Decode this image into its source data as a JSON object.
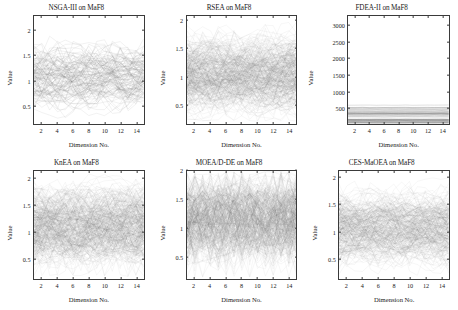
{
  "figure": {
    "name": "parallel-coordinates-grid",
    "rows": 2,
    "cols": 3,
    "background": "#ffffff",
    "line_color": "#6e6e6e",
    "axis_color": "#3a3a3a",
    "text_color": "#1a1a1a"
  },
  "common": {
    "xlabel": "Dimension No.",
    "ylabel": "Value",
    "xticks": [
      "2",
      "4",
      "6",
      "8",
      "10",
      "12",
      "14"
    ],
    "xtick_values": [
      2,
      4,
      6,
      8,
      10,
      12,
      14
    ],
    "xlim": [
      1,
      15
    ],
    "dimensions": 15
  },
  "chart_data": [
    {
      "type": "line",
      "panel": 1,
      "title": "NSGA-III on MaF8",
      "xlabel": "Dimension No.",
      "ylabel": "Value",
      "xlim": [
        1,
        15
      ],
      "ylim": [
        0.12,
        2.3
      ],
      "xticks": [
        2,
        4,
        6,
        8,
        10,
        12,
        14
      ],
      "yticks": [
        0.5,
        1,
        1.5,
        2
      ],
      "ytick_labels": [
        "0.5",
        "1",
        "1.5",
        "2"
      ],
      "grid": false,
      "legend": "none",
      "plot_style": "parallel-coordinates",
      "n_lines": 120,
      "band": {
        "center": 1.05,
        "spread": 0.42,
        "min": 0.18,
        "max": 2.25
      },
      "description": "Sparse wide-swinging parallel coordinate lines, dense core near 1.0-1.5"
    },
    {
      "type": "line",
      "panel": 2,
      "title": "RSEA on MaF8",
      "xlabel": "Dimension No.",
      "ylabel": "Value",
      "xlim": [
        1,
        15
      ],
      "ylim": [
        0.15,
        2.08
      ],
      "xticks": [
        2,
        4,
        6,
        8,
        10,
        12,
        14
      ],
      "yticks": [
        0.5,
        1,
        1.5,
        2
      ],
      "ytick_labels": [
        "0.5",
        "1",
        "1.5",
        "2"
      ],
      "grid": false,
      "legend": "none",
      "plot_style": "parallel-coordinates",
      "n_lines": 300,
      "band": {
        "center": 1.05,
        "spread": 0.45,
        "min": 0.2,
        "max": 2.0
      },
      "description": "Very dense band filling 0.4-1.9, saturated core"
    },
    {
      "type": "line",
      "panel": 3,
      "title": "FDEA-II on MaF8",
      "xlabel": "Dimension No.",
      "ylabel": "Value",
      "xlim": [
        1,
        15
      ],
      "ylim": [
        0,
        3300
      ],
      "xticks": [
        2,
        4,
        6,
        8,
        10,
        12,
        14
      ],
      "yticks": [
        500,
        1000,
        1500,
        2000,
        2500,
        3000
      ],
      "ytick_labels": [
        "500",
        "1000",
        "1500",
        "2000",
        "2500",
        "3000"
      ],
      "grid": false,
      "legend": "none",
      "plot_style": "parallel-coordinates",
      "n_lines": 40,
      "band": {
        "center": 250,
        "spread": 260,
        "min": 20,
        "max": 620
      },
      "description": "Nearly flat horizontal lines clustered below 650, mostly empty upper area"
    },
    {
      "type": "line",
      "panel": 4,
      "title": "KnEA on MaF8",
      "xlabel": "Dimension No.",
      "ylabel": "Value",
      "xlim": [
        1,
        15
      ],
      "ylim": [
        0.1,
        2.15
      ],
      "xticks": [
        2,
        4,
        6,
        8,
        10,
        12,
        14
      ],
      "yticks": [
        0.5,
        1,
        1.5,
        2
      ],
      "ytick_labels": [
        "0.5",
        "1",
        "1.5",
        "2"
      ],
      "grid": false,
      "legend": "none",
      "plot_style": "parallel-coordinates",
      "n_lines": 300,
      "band": {
        "center": 1.1,
        "spread": 0.5,
        "min": 0.15,
        "max": 2.1
      },
      "description": "Dense criss-cross mesh spanning 0.2-2.1"
    },
    {
      "type": "line",
      "panel": 5,
      "title": "MOEA/D-DE on MaF8",
      "xlabel": "Dimension No.",
      "ylabel": "Value",
      "xlim": [
        1,
        15
      ],
      "ylim": [
        0.1,
        2.0
      ],
      "xticks": [
        2,
        4,
        6,
        8,
        10,
        12,
        14
      ],
      "yticks": [
        0.5,
        1,
        1.5,
        2
      ],
      "ytick_labels": [
        "0.5",
        "1",
        "1.5",
        "2"
      ],
      "grid": false,
      "legend": "none",
      "plot_style": "parallel-coordinates",
      "n_lines": 300,
      "band": {
        "center": 1.15,
        "spread": 0.5,
        "min": 0.12,
        "max": 2.0
      },
      "description": "Regular zig-zag lattice pattern, dense top, V-shaped bottom fringe"
    },
    {
      "type": "line",
      "panel": 6,
      "title": "CES-MaOEA on MaF8",
      "xlabel": "Dimension No.",
      "ylabel": "Value",
      "xlim": [
        1,
        15
      ],
      "ylim": [
        0.12,
        2.12
      ],
      "xticks": [
        2,
        4,
        6,
        8,
        10,
        12,
        14
      ],
      "yticks": [
        0.5,
        1,
        1.5,
        2
      ],
      "ytick_labels": [
        "0.5",
        "1",
        "1.5",
        "2"
      ],
      "grid": false,
      "legend": "none",
      "plot_style": "parallel-coordinates",
      "n_lines": 260,
      "band": {
        "center": 1.05,
        "spread": 0.42,
        "min": 0.18,
        "max": 2.1
      },
      "description": "Dense band 0.5-1.7 with sparse outliers reaching 2.1 and 0.2"
    }
  ]
}
